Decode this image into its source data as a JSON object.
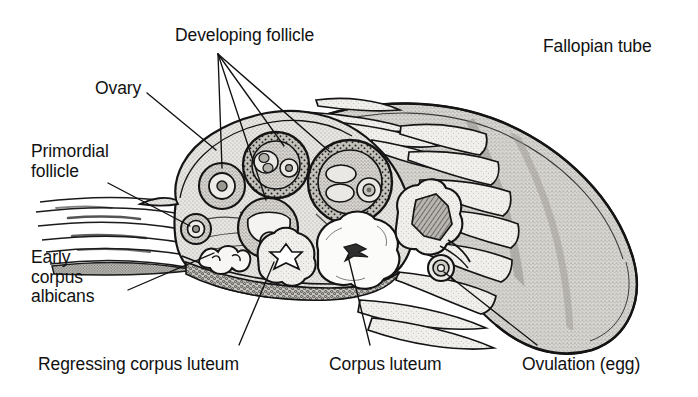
{
  "figure": {
    "kind": "anatomical-illustration",
    "style": "black-and-white stippled line drawing",
    "background_color": "#ffffff",
    "ink_color": "#111111"
  },
  "labels": {
    "developing_follicle": "Developing follicle",
    "fallopian_tube": "Fallopian tube",
    "ovary": "Ovary",
    "primordial_follicle_line1": "Primordial",
    "primordial_follicle_line2": "follicle",
    "early_corpus_albicans_line1": "Early",
    "early_corpus_albicans_line2": "corpus",
    "early_corpus_albicans_line3": "albicans",
    "regressing_corpus_luteum": "Regressing corpus luteum",
    "corpus_luteum": "Corpus luteum",
    "ovulation_egg": "Ovulation (egg)"
  },
  "colors": {
    "ink": "#111111",
    "stroma_fill": "#e3e1dc",
    "follicle_fill": "#c9c6c0",
    "antrum_fill": "#f2f1ee",
    "tube_fill": "#d7d5d0",
    "corpus_luteum_fill": "#fbfbfa",
    "medulla_fill": "#cdcac4",
    "ruptured_fill": "#a9a5a0"
  },
  "structures": [
    {
      "name": "developing-follicle-upper-left",
      "stage": "primary follicle"
    },
    {
      "name": "developing-follicle-upper-mid",
      "stage": "secondary follicle"
    },
    {
      "name": "developing-follicle-antral",
      "stage": "antral follicle"
    },
    {
      "name": "developing-follicle-mature",
      "stage": "mature Graafian follicle"
    },
    {
      "name": "primordial-follicle",
      "stage": "primordial"
    },
    {
      "name": "early-corpus-albicans",
      "stage": "corpus albicans"
    },
    {
      "name": "regressing-corpus-luteum",
      "stage": "regressing"
    },
    {
      "name": "corpus-luteum",
      "stage": "mature corpus luteum"
    },
    {
      "name": "ruptured-follicle",
      "stage": "ruptured"
    },
    {
      "name": "ovulated-egg",
      "stage": "ovulated oocyte"
    },
    {
      "name": "fallopian-tube-infundibulum",
      "stage": "infundibulum with fimbriae"
    }
  ]
}
